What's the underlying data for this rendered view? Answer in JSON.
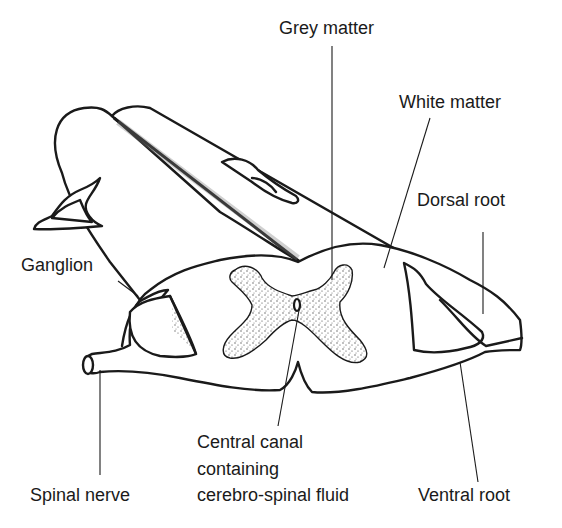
{
  "diagram": {
    "labels": {
      "grey_matter": "Grey matter",
      "white_matter": "White matter",
      "dorsal_root": "Dorsal root",
      "ganglion": "Ganglion",
      "spinal_nerve": "Spinal nerve",
      "central_canal_line1": "Central canal",
      "central_canal_line2": "containing",
      "central_canal_line3": "cerebro-spinal fluid",
      "ventral_root": "Ventral root"
    },
    "colors": {
      "line": "#1a1a1a",
      "background": "#ffffff",
      "stipple": "#555555"
    }
  }
}
